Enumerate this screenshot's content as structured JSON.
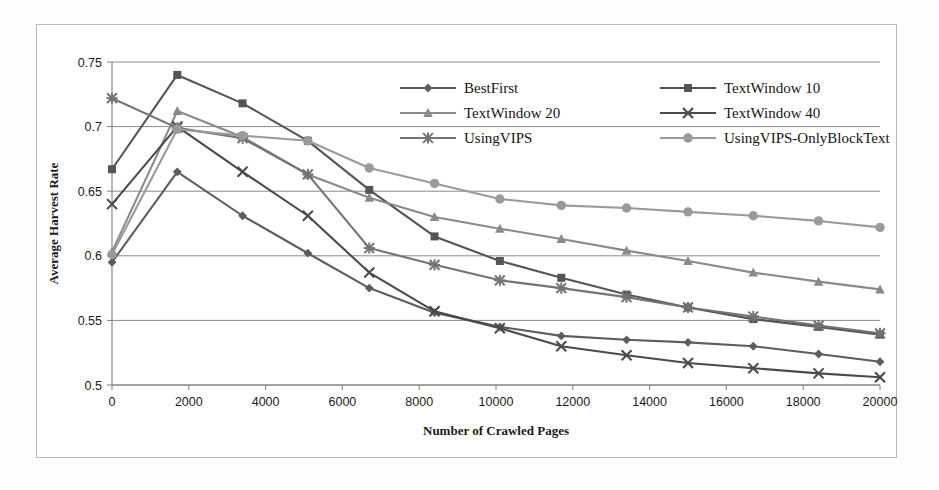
{
  "chart_data": {
    "type": "line",
    "title": "",
    "xlabel": "Number of Crawled Pages",
    "ylabel": "Average Harvest Rate",
    "xlim": [
      0,
      20000
    ],
    "ylim": [
      0.5,
      0.75
    ],
    "yticks": [
      "0.5",
      "0.55",
      "0.6",
      "0.65",
      "0.7",
      "0.75"
    ],
    "ytick_values": [
      0.5,
      0.55,
      0.6,
      0.65,
      0.7,
      0.75
    ],
    "xticks": [
      "0",
      "2000",
      "4000",
      "6000",
      "8000",
      "10000",
      "12000",
      "14000",
      "16000",
      "18000",
      "20000"
    ],
    "xtick_values": [
      0,
      2000,
      4000,
      6000,
      8000,
      10000,
      12000,
      14000,
      16000,
      18000,
      20000
    ],
    "grid": true,
    "legend_position": "top-right-inside",
    "x": [
      0,
      1700,
      3400,
      5100,
      6700,
      8400,
      10100,
      11700,
      13400,
      15000,
      16700,
      18400,
      20000
    ],
    "series": [
      {
        "name": "BestFirst",
        "marker": "diamond",
        "color": "#5d5d5d",
        "values": [
          0.595,
          0.665,
          0.631,
          0.602,
          0.575,
          0.556,
          0.545,
          0.538,
          0.535,
          0.533,
          0.53,
          0.524,
          0.518
        ]
      },
      {
        "name": "TextWindow 10",
        "marker": "square",
        "color": "#555555",
        "values": [
          0.667,
          0.74,
          0.718,
          0.689,
          0.651,
          0.615,
          0.596,
          0.583,
          0.57,
          0.56,
          0.551,
          0.545,
          0.539
        ]
      },
      {
        "name": "TextWindow 20",
        "marker": "triangle",
        "color": "#8a8a8a",
        "values": [
          0.603,
          0.712,
          0.692,
          0.663,
          0.645,
          0.63,
          0.621,
          0.613,
          0.604,
          0.596,
          0.587,
          0.58,
          0.574
        ]
      },
      {
        "name": "TextWindow 40",
        "marker": "x",
        "color": "#4a4a4a",
        "values": [
          0.64,
          0.7,
          0.665,
          0.631,
          0.587,
          0.557,
          0.544,
          0.53,
          0.523,
          0.517,
          0.513,
          0.509,
          0.506
        ]
      },
      {
        "name": "UsingVIPS",
        "marker": "asterisk",
        "color": "#737373",
        "values": [
          0.722,
          0.699,
          0.691,
          0.663,
          0.606,
          0.593,
          0.581,
          0.575,
          0.568,
          0.56,
          0.553,
          0.546,
          0.54
        ]
      },
      {
        "name": "UsingVIPS-OnlyBlockText",
        "marker": "circle",
        "color": "#9a9a9a",
        "values": [
          0.601,
          0.698,
          0.693,
          0.689,
          0.668,
          0.656,
          0.644,
          0.639,
          0.637,
          0.634,
          0.631,
          0.627,
          0.622
        ]
      }
    ]
  },
  "legend": {
    "entries": [
      {
        "label": "BestFirst"
      },
      {
        "label": "TextWindow 10"
      },
      {
        "label": "TextWindow 20"
      },
      {
        "label": "TextWindow 40"
      },
      {
        "label": "UsingVIPS"
      },
      {
        "label": "UsingVIPS-OnlyBlockText"
      }
    ]
  }
}
